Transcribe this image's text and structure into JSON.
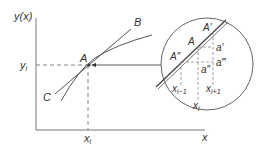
{
  "diagram": {
    "axes": {
      "y_label": "y(x)",
      "x_label": "x",
      "y_tick_label": "y",
      "y_tick_sub": "i",
      "x_tick_label": "x",
      "x_tick_sub": "i"
    },
    "curve_labels": {
      "point": "A",
      "upper": "B",
      "lower": "C"
    },
    "inset": {
      "labels": {
        "A_prime": "A′",
        "A": "A",
        "A_double_prime": "A″",
        "a_prime": "a′",
        "a_double_prime": "a″",
        "a_triple_prime": "a‴",
        "x_prev": "x",
        "x_prev_sub": "i−1",
        "x_next": "x",
        "x_next_sub": "i+1",
        "x_mid": "x",
        "x_mid_sub": "i"
      }
    },
    "colors": {
      "line": "#555555",
      "dashed": "#777777",
      "text": "#333333"
    }
  }
}
